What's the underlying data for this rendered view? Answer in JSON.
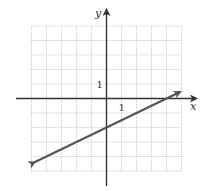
{
  "chart_data": {
    "type": "line",
    "title": "",
    "xlabel": "x",
    "ylabel": "y",
    "xlim": [
      -5,
      5
    ],
    "ylim": [
      -5,
      5
    ],
    "grid": true,
    "tick_labels": {
      "x": [
        "1"
      ],
      "y": [
        "1"
      ]
    },
    "series": [
      {
        "name": "line",
        "equation": "y = 0.5x - 2",
        "slope": 0.5,
        "intercept": -2,
        "x": [
          -4.8,
          0,
          4,
          4.9
        ],
        "y": [
          -4.4,
          -2,
          0,
          0.45
        ],
        "arrows": "both"
      }
    ],
    "colors": {
      "line": "#555555",
      "axis": "#333333",
      "grid": "#bbbbbb"
    }
  }
}
